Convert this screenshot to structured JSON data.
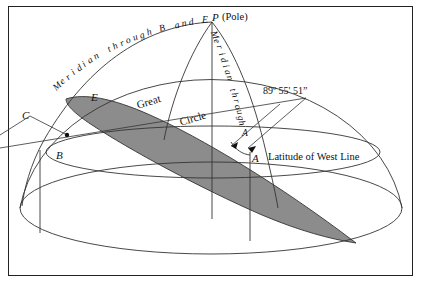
{
  "figure": {
    "background_color": "#ffffff",
    "frame_color": "#222222",
    "line_color": "#333333",
    "shade_color": "#8c8c8c"
  },
  "labels": {
    "pole": "P",
    "pole_paren": "(Pole)",
    "point_a": "A",
    "point_b": "B",
    "point_c": "C",
    "point_e": "E",
    "angle": "89º 55' 51”",
    "latitude_of_west_line": "Latitude of West Line",
    "great": "Great",
    "circle": "Circle",
    "meridian_be": "Meridian through B and E",
    "meridian_a": "Meridian through A"
  },
  "curved_text": {
    "meridian_be_chars": [
      "M",
      "e",
      "r",
      "i",
      "d",
      "i",
      "a",
      "n",
      " ",
      "t",
      "h",
      "r",
      "o",
      "u",
      "g",
      "h",
      " ",
      "B",
      " ",
      "a",
      "n",
      "d",
      " ",
      "E"
    ],
    "meridian_a_chars": [
      "M",
      "e",
      "r",
      "i",
      "d",
      "i",
      "a",
      "n",
      " ",
      "t",
      "h",
      "r",
      "o",
      "u",
      "g",
      "h",
      " ",
      "A"
    ]
  }
}
